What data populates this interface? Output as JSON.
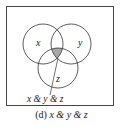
{
  "diagram": {
    "type": "venn",
    "sets": [
      {
        "label": "x",
        "cx": 43,
        "cy": 44,
        "r": 20
      },
      {
        "label": "y",
        "cx": 71,
        "cy": 44,
        "r": 20
      },
      {
        "label": "z",
        "cx": 58,
        "cy": 68,
        "r": 20
      }
    ],
    "highlighted_region": "x & y & z",
    "highlight_color": "#a8a8a8",
    "pointer_label": "x & y & z",
    "caption_prefix": "(d)",
    "caption_expr": "x & y & z"
  }
}
